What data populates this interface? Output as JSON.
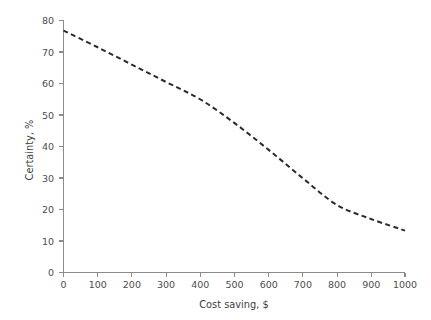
{
  "chart_data": {
    "type": "line",
    "title": "",
    "subtitle": "",
    "xlabel": "Cost saving, $",
    "ylabel": "Certainty, %",
    "xlim": [
      0,
      1000
    ],
    "ylim": [
      0,
      80
    ],
    "xticks": [
      0,
      100,
      200,
      300,
      400,
      500,
      600,
      700,
      800,
      900,
      1000
    ],
    "yticks": [
      0,
      10,
      20,
      30,
      40,
      50,
      60,
      70,
      80
    ],
    "xtick_labels": [
      "0",
      "100",
      "200",
      "300",
      "400",
      "500",
      "600",
      "700",
      "800",
      "900",
      "1000"
    ],
    "ytick_labels": [
      "0",
      "10",
      "20",
      "30",
      "40",
      "50",
      "60",
      "70",
      "80"
    ],
    "grid": false,
    "legend": null,
    "legend_position": "none",
    "annotations": [],
    "series": [
      {
        "name": "Certainty vs cost saving",
        "style": "dashed",
        "color": "#2b2b2b",
        "x": [
          0,
          100,
          200,
          300,
          400,
          500,
          600,
          700,
          800,
          900,
          1000
        ],
        "values": [
          76.8,
          71.5,
          66.0,
          60.5,
          55.0,
          47.5,
          39.0,
          30.0,
          21.5,
          17.0,
          13.3
        ]
      }
    ]
  },
  "axis_style": {
    "axis_color": "#8c8c8c",
    "tick_label_color": "#4d4d4d",
    "axis_title_color": "#3d3d3d",
    "background": "#ffffff"
  }
}
